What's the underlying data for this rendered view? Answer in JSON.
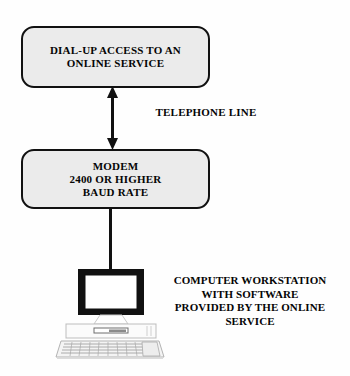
{
  "diagram": {
    "background_color": "#fefefe",
    "node_fill_color": "#ebebeb",
    "line_color": "#111111",
    "nodes": [
      {
        "id": "online-service",
        "label": "DIAL-UP ACCESS TO AN\nONLINE SERVICE",
        "shape": "rounded-rectangle"
      },
      {
        "id": "modem",
        "label": "MODEM\n2400 OR HIGHER\nBAUD RATE",
        "shape": "rounded-rectangle"
      }
    ],
    "connectors": [
      {
        "id": "telephone-line",
        "label": "TELEPHONE LINE",
        "style": "double-headed-arrow",
        "from": "modem",
        "to": "online-service"
      },
      {
        "id": "serial-cable",
        "label": "",
        "style": "plain-line",
        "from": "modem",
        "to": "computer-workstation"
      }
    ],
    "illustration": {
      "id": "computer-workstation",
      "icon_name": "desktop-computer-icon",
      "caption": "COMPUTER WORKSTATION\nWITH SOFTWARE\nPROVIDED BY THE ONLINE\nSERVICE"
    }
  }
}
